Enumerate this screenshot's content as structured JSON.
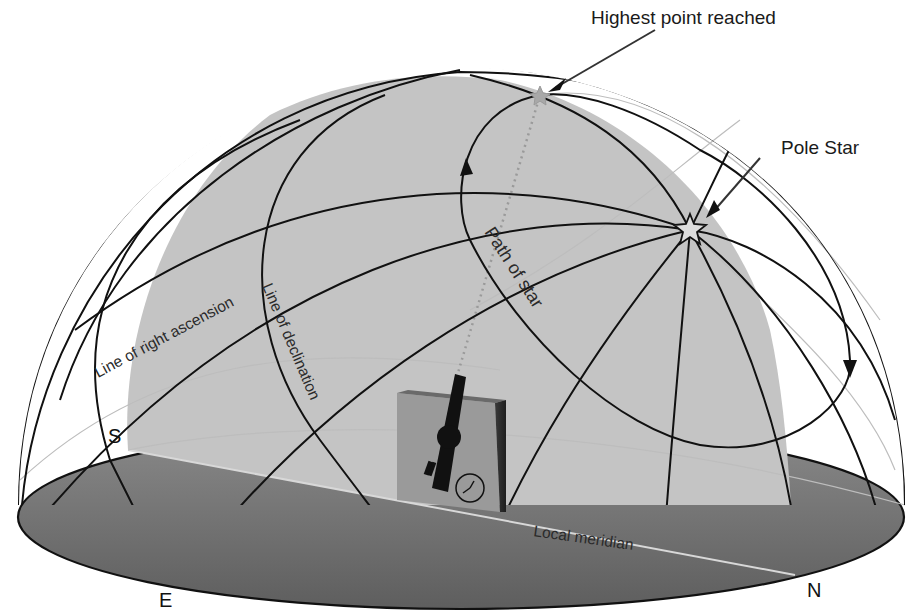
{
  "diagram": {
    "labels": {
      "highest_point": "Highest point reached",
      "pole_star": "Pole Star",
      "path_of_star": "Path of star",
      "line_of_right_ascension": "Line of right ascension",
      "line_of_declination": "Line of declination",
      "local_meridian": "Local meridian"
    },
    "compass": {
      "south": "S",
      "east": "E",
      "north": "N"
    },
    "colors": {
      "background": "#ffffff",
      "meridian_plane": "#c4c4c4",
      "ground_plane": "#6e6e6e",
      "ground_plane_light": "#8a8a8a",
      "lines": "#111111",
      "faint_lines": "#bdbdbd",
      "telescope_box": "#9a9a9a",
      "telescope": "#111111"
    },
    "icons": {
      "telescope": "telescope-icon",
      "clock": "clock-icon",
      "pole_star": "star-icon",
      "highest_point_star": "star-icon"
    }
  }
}
